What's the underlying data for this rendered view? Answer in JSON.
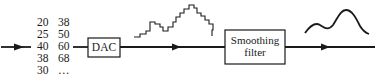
{
  "diagram": {
    "type": "signal-flow",
    "samples": {
      "column1": [
        "20",
        "25",
        "40",
        "38",
        "30"
      ],
      "column2": [
        "38",
        "50",
        "60",
        "68",
        "…"
      ]
    },
    "blocks": [
      {
        "id": "dac",
        "label": "DAC"
      },
      {
        "id": "smoothing",
        "label_line1": "Smoothing",
        "label_line2": "filter"
      }
    ],
    "waveforms": {
      "dac_output": "staircase",
      "filter_output": "smooth-curve"
    },
    "colors": {
      "stroke": "#1a1a1a",
      "background": "#ffffff"
    }
  }
}
